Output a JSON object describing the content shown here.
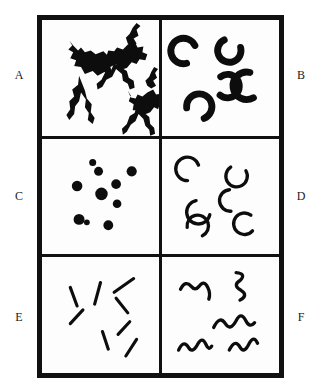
{
  "figure": {
    "kind": "shape-texture-panel-grid",
    "columns": 2,
    "rows": 3,
    "background_color": "#ffffff",
    "ink_color": "#0d0d0d",
    "frame_color": "#111111",
    "panel_background": "#fdfdfd"
  },
  "labels": {
    "a": "A",
    "b": "B",
    "c": "C",
    "d": "D",
    "e": "E",
    "f": "F"
  },
  "panels": [
    {
      "id": "A",
      "label": "A",
      "position": "row1-left",
      "element_kind": "irregular-splatter-blob",
      "element_count": 3,
      "element_color": "#0d0d0d",
      "description": "three large irregular jagged splatter blobs with wiggly radiating limbs"
    },
    {
      "id": "B",
      "label": "B",
      "position": "row1-right",
      "element_kind": "thick-crescent",
      "element_count": 5,
      "element_color": "#0d0d0d",
      "description": "five thick filled crescent arcs at varied rotations"
    },
    {
      "id": "C",
      "label": "C",
      "position": "row2-left",
      "element_kind": "filled-dot",
      "element_count": 10,
      "element_color": "#0d0d0d",
      "description": "ten filled round dots of varying size scattered in the panel"
    },
    {
      "id": "D",
      "label": "D",
      "position": "row2-right",
      "element_kind": "thin-crescent",
      "element_count": 6,
      "element_color": "#0d0d0d",
      "description": "six thin open crescent arcs at varied rotations"
    },
    {
      "id": "E",
      "label": "E",
      "position": "row3-left",
      "element_kind": "straight-line-segment",
      "element_count": 8,
      "element_color": "#0d0d0d",
      "description": "eight short straight line segments at varied orientations"
    },
    {
      "id": "F",
      "label": "F",
      "position": "row3-right",
      "element_kind": "wavy-squiggle",
      "element_count": 5,
      "element_color": "#0d0d0d",
      "description": "five wavy squiggle strokes at varied orientations"
    }
  ]
}
